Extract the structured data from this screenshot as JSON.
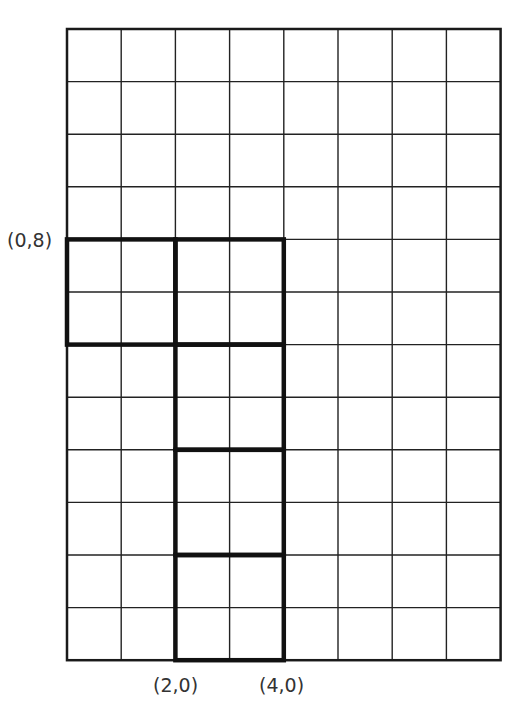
{
  "diagram": {
    "type": "grid-shape",
    "grid": {
      "columns": 8,
      "rows": 12,
      "origin_px": {
        "left": 67,
        "top": 29
      },
      "cell_px": {
        "width": 54.2,
        "height": 52.6
      },
      "thin_line_color": "#222222",
      "thick_line_color": "#111111"
    },
    "shapes": [
      {
        "name": "square-a",
        "x0": 0,
        "y0": 6,
        "x1": 2,
        "y1": 8
      },
      {
        "name": "square-b",
        "x0": 2,
        "y0": 6,
        "x1": 4,
        "y1": 8
      },
      {
        "name": "square-c",
        "x0": 2,
        "y0": 4,
        "x1": 4,
        "y1": 6
      },
      {
        "name": "square-d",
        "x0": 2,
        "y0": 2,
        "x1": 4,
        "y1": 4
      },
      {
        "name": "square-e",
        "x0": 2,
        "y0": 0,
        "x1": 4,
        "y1": 2
      }
    ],
    "labels": [
      {
        "id": "label_0_8",
        "text": "(0,8)",
        "left": 7,
        "top": 229
      },
      {
        "id": "label_2_0",
        "text": "(2,0)",
        "left": 153,
        "top": 674
      },
      {
        "id": "label_4_0",
        "text": "(4,0)",
        "left": 259,
        "top": 674
      }
    ]
  }
}
